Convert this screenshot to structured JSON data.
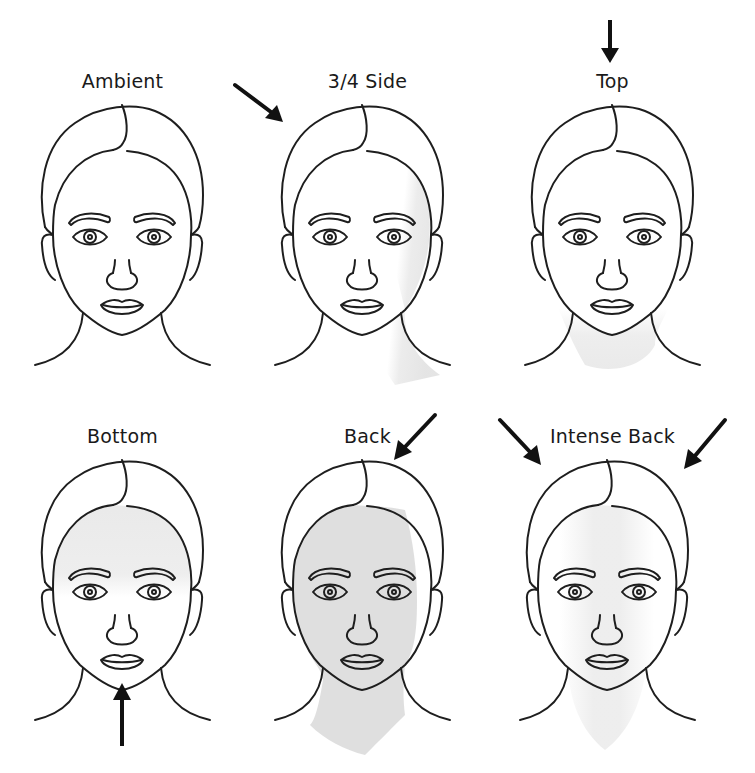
{
  "colors": {
    "line": "#1e1e1e",
    "shade": "#d9d9d9",
    "background": "#ffffff"
  },
  "panels": [
    {
      "id": "ambient",
      "label": "Ambient",
      "arrows": [],
      "shading": "none"
    },
    {
      "id": "three-quarter-side",
      "label": "3/4 Side",
      "arrows": [
        "upper-left pointing down-right"
      ],
      "shading": "right side of face and neck"
    },
    {
      "id": "top",
      "label": "Top",
      "arrows": [
        "above pointing down"
      ],
      "shading": "lower face and neck"
    },
    {
      "id": "bottom",
      "label": "Bottom",
      "arrows": [
        "below pointing up"
      ],
      "shading": "upper face and forehead"
    },
    {
      "id": "back",
      "label": "Back",
      "arrows": [
        "upper-right pointing down-left"
      ],
      "shading": "entire face and neck"
    },
    {
      "id": "intense-back",
      "label": "Intense Back",
      "arrows": [
        "upper-left pointing down-right",
        "upper-right pointing down-left"
      ],
      "shading": "central face and neck"
    }
  ]
}
